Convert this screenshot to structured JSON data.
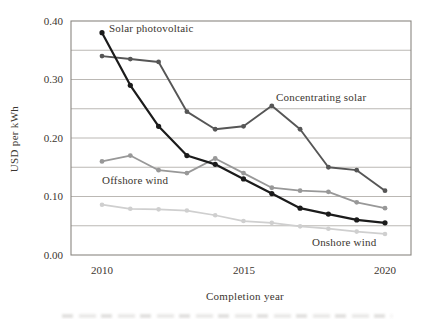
{
  "chart_data": {
    "type": "line",
    "title": "",
    "xlabel": "Completion year",
    "ylabel": "USD per kWh",
    "x": [
      2010,
      2011,
      2012,
      2013,
      2014,
      2015,
      2016,
      2017,
      2018,
      2019,
      2020
    ],
    "xlim": [
      2008.9,
      2020.9
    ],
    "ylim": [
      0.0,
      0.4
    ],
    "y_tick_labels": [
      "0.40",
      "0.30",
      "0.20",
      "0.10",
      "0.00"
    ],
    "y_tick_values": [
      0.4,
      0.3,
      0.2,
      0.1,
      0.0
    ],
    "x_tick_labels": [
      "2010",
      "2015",
      "2020"
    ],
    "x_tick_values": [
      2010,
      2015,
      2020
    ],
    "grid": "horizontal gridlines every 0.05, framed plot box",
    "legend_position": "inline annotations next to lines",
    "series": [
      {
        "name": "Solar photovoltaic",
        "color": "#1b1b1b",
        "values": [
          0.38,
          0.29,
          0.22,
          0.17,
          0.155,
          0.13,
          0.105,
          0.08,
          0.07,
          0.06,
          0.055
        ]
      },
      {
        "name": "Concentrating solar",
        "color": "#565656",
        "values": [
          0.34,
          0.335,
          0.33,
          0.245,
          0.215,
          0.22,
          0.255,
          0.215,
          0.15,
          0.145,
          0.11
        ]
      },
      {
        "name": "Offshore wind",
        "color": "#989898",
        "values": [
          0.16,
          0.17,
          0.145,
          0.14,
          0.165,
          0.14,
          0.115,
          0.11,
          0.108,
          0.09,
          0.08
        ]
      },
      {
        "name": "Onshore wind",
        "color": "#cfcfcf",
        "values": [
          0.086,
          0.079,
          0.078,
          0.076,
          0.068,
          0.058,
          0.055,
          0.049,
          0.045,
          0.04,
          0.036
        ]
      }
    ],
    "colors": {
      "grid_line": "#b3b0ab",
      "frame": "#8a8781",
      "text": "#3b3630"
    }
  }
}
